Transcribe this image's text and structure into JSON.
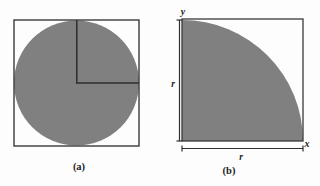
{
  "figure": {
    "background_color": "#fdfdfd",
    "fill_color": "#808080",
    "stroke_color": "#3a3a3a",
    "panels": [
      {
        "id": "a",
        "caption": "(a)",
        "description": "square-with-inscribed-circle-and-quadrant",
        "square": {
          "x": 14,
          "y": 20,
          "width": 125,
          "height": 126
        },
        "circle": {
          "cx": 76.5,
          "cy": 83,
          "r": 62.5
        },
        "quadrant_corner": {
          "x": 76.5,
          "y": 83
        },
        "labels": []
      },
      {
        "id": "b",
        "caption": "(b)",
        "description": "square-with-quarter-circle",
        "square": {
          "x": 182,
          "y": 19,
          "width": 121,
          "height": 122
        },
        "quarter_circle": {
          "cx": 182,
          "cy": 141,
          "r": 121
        },
        "labels": [
          {
            "name": "y-axis-label",
            "text": "y",
            "x": 184,
            "y": 14
          },
          {
            "name": "x-axis-label",
            "text": "x",
            "x": 305,
            "y": 146
          },
          {
            "name": "radius-label-vertical",
            "text": "r",
            "x": 172,
            "y": 84
          },
          {
            "name": "radius-label-horizontal",
            "text": "r",
            "x": 240,
            "y": 158
          }
        ],
        "dimensions": {
          "vertical": {
            "label": "r",
            "x": 180,
            "y1": 20,
            "y2": 141
          },
          "horizontal": {
            "label": "r",
            "y": 149,
            "x1": 182,
            "x2": 303
          }
        }
      }
    ],
    "captions": {
      "a_x": 79,
      "a_y": 168,
      "b_x": 228,
      "b_y": 172
    }
  }
}
